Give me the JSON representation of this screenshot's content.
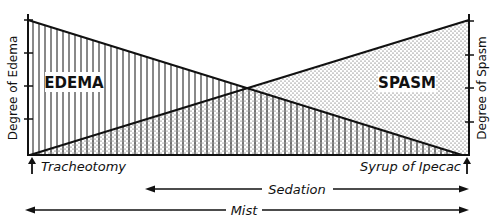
{
  "diagram": {
    "left_axis_label": "Degree of Edema",
    "right_axis_label": "Degree of Spasm",
    "region_left_label": "EDEMA",
    "region_right_label": "SPASM",
    "start_event": "Tracheotomy",
    "end_event": "Syrup of Ipecac",
    "arrows": [
      {
        "label": "Sedation",
        "from_x": 145,
        "to_x": 468,
        "y": 189
      },
      {
        "label": "Mist",
        "from_x": 25,
        "to_x": 468,
        "y": 210
      }
    ],
    "geometry": {
      "left_axis_x": 28,
      "right_axis_x": 469,
      "top_y": 20,
      "baseline_y": 155,
      "left_ticks_y": [
        20,
        53,
        86,
        119
      ],
      "right_ticks_y": [
        21,
        55,
        88,
        122
      ],
      "crossing": {
        "x": 248,
        "y": 88
      }
    },
    "colors": {
      "ink": "#111111",
      "background": "#ffffff"
    }
  }
}
